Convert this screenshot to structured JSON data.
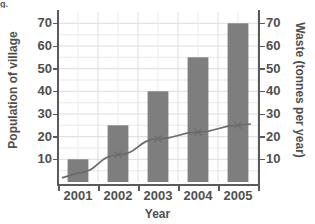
{
  "corner_mark": "g.",
  "chart_data": {
    "type": "bar",
    "title": "",
    "subtitle": "",
    "xlabel": "Year",
    "ylabel": "Population of village",
    "y2label": "Waste (tonnes per year)",
    "categories": [
      "2001",
      "2002",
      "2003",
      "2004",
      "2005"
    ],
    "ylim": [
      0,
      75
    ],
    "y2lim": [
      0,
      75
    ],
    "yticks": [
      10,
      20,
      30,
      40,
      50,
      60,
      70
    ],
    "y2ticks": [
      10,
      20,
      30,
      40,
      50,
      60,
      70
    ],
    "grid": true,
    "legend": "none",
    "series": [
      {
        "name": "Population of village",
        "type": "bar",
        "axis": "left",
        "color": "#7e7e7e",
        "values": [
          10,
          25,
          40,
          55,
          70
        ]
      },
      {
        "name": "Waste (tonnes per year)",
        "type": "line",
        "axis": "right",
        "color": "#6b6b6b",
        "marker": "x",
        "values": [
          4,
          12,
          19,
          22,
          25
        ]
      }
    ]
  },
  "axes": {
    "left_ticks": [
      "70",
      "60",
      "50",
      "40",
      "30",
      "20",
      "10"
    ],
    "right_ticks": [
      "70",
      "60",
      "50",
      "40",
      "30",
      "20",
      "10"
    ],
    "x_ticks": [
      "2001",
      "2002",
      "2003",
      "2004",
      "2005"
    ],
    "x_title": "Year",
    "y_left_title": "Population of village",
    "y_right_title": "Waste (tonnes per year)"
  },
  "colors": {
    "bar": "#7e7e7e",
    "line": "#6b6b6b",
    "axis": "#5a5a5a",
    "grid": "#d8d8d8",
    "text": "#4f4f4f",
    "background": "#ffffff"
  }
}
